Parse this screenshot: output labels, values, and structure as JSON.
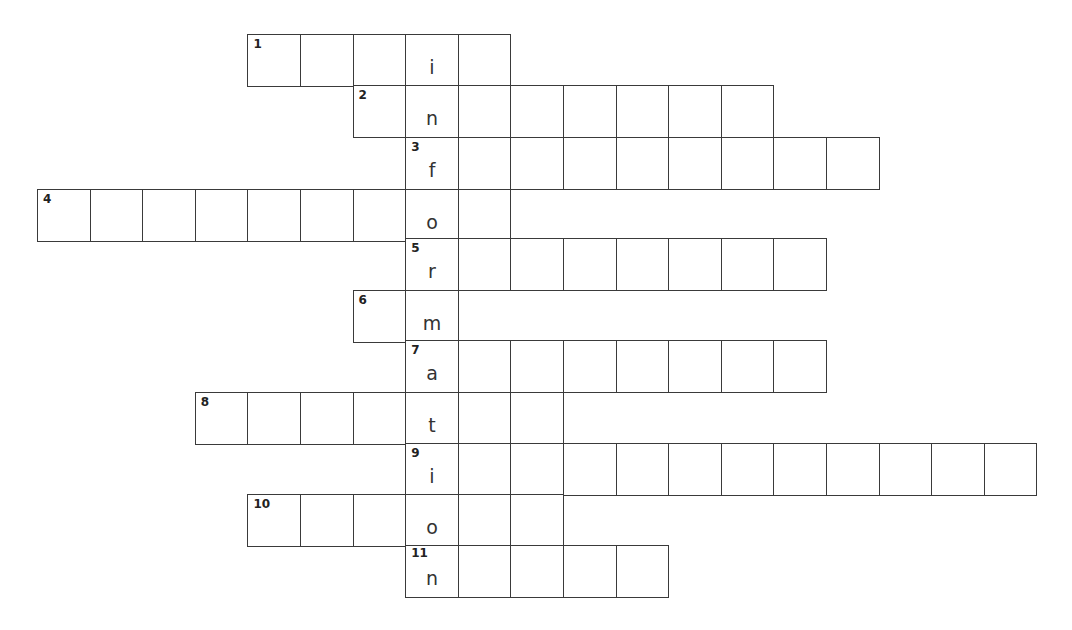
{
  "puzzle": {
    "hidden_word": "information",
    "key_column": 7,
    "rows": [
      {
        "number": "1",
        "start_col": 4,
        "length": 5,
        "key_letter": "i"
      },
      {
        "number": "2",
        "start_col": 6,
        "length": 8,
        "key_letter": "n"
      },
      {
        "number": "3",
        "start_col": 7,
        "length": 9,
        "key_letter": "f"
      },
      {
        "number": "4",
        "start_col": 0,
        "length": 9,
        "key_letter": "o"
      },
      {
        "number": "5",
        "start_col": 7,
        "length": 8,
        "key_letter": "r"
      },
      {
        "number": "6",
        "start_col": 6,
        "length": 2,
        "key_letter": "m"
      },
      {
        "number": "7",
        "start_col": 7,
        "length": 8,
        "key_letter": "a"
      },
      {
        "number": "8",
        "start_col": 3,
        "length": 7,
        "key_letter": "t"
      },
      {
        "number": "9",
        "start_col": 7,
        "length": 12,
        "key_letter": "i"
      },
      {
        "number": "10",
        "start_col": 4,
        "length": 6,
        "key_letter": "o"
      },
      {
        "number": "11",
        "start_col": 7,
        "length": 5,
        "key_letter": "n"
      }
    ]
  },
  "layout": {
    "origin_x": 37,
    "cell_w": 52.6,
    "row_tops": [
      34,
      85,
      137,
      189,
      238,
      290,
      340,
      392,
      443,
      494,
      545
    ],
    "cell_h": 52
  },
  "colors": {
    "border": "#3a3a3a",
    "text": "#333333"
  }
}
